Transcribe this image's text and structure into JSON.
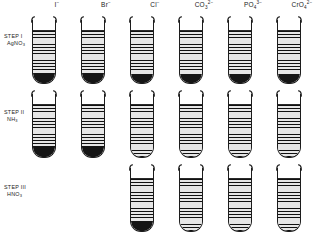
{
  "figure": {
    "tube_count_per_row": 6
  },
  "columns": [
    {
      "id": "iodide",
      "label_main": "I",
      "label_sub": "",
      "label_sup": "−",
      "x": 44
    },
    {
      "id": "bromide",
      "label_main": "Br",
      "label_sub": "",
      "label_sup": "−",
      "x": 93
    },
    {
      "id": "chloride",
      "label_main": "Cl",
      "label_sub": "",
      "label_sup": "−",
      "x": 142
    },
    {
      "id": "carbonate",
      "label_main": "CO",
      "label_sub": "3",
      "label_sup": "2−",
      "x": 191
    },
    {
      "id": "phosphate",
      "label_main": "PO",
      "label_sub": "4",
      "label_sup": "3−",
      "x": 240
    },
    {
      "id": "chromate",
      "label_main": "CrO",
      "label_sub": "4",
      "label_sup": "2−",
      "x": 289
    }
  ],
  "rows": [
    {
      "id": "step-1",
      "step_name": "STEP I",
      "reagent_main": "AgNO",
      "reagent_sub": "3",
      "label_top": 33,
      "tube_top": 16,
      "tubes": [
        {
          "column": "iodide",
          "present": true,
          "liquid_height": 52,
          "precipitate_height": 11
        },
        {
          "column": "bromide",
          "present": true,
          "liquid_height": 52,
          "precipitate_height": 11
        },
        {
          "column": "chloride",
          "present": true,
          "liquid_height": 52,
          "precipitate_height": 10
        },
        {
          "column": "carbonate",
          "present": true,
          "liquid_height": 52,
          "precipitate_height": 10
        },
        {
          "column": "phosphate",
          "present": true,
          "liquid_height": 52,
          "precipitate_height": 10
        },
        {
          "column": "chromate",
          "present": true,
          "liquid_height": 52,
          "precipitate_height": 10
        }
      ]
    },
    {
      "id": "step-2",
      "step_name": "STEP II",
      "reagent_main": "NH",
      "reagent_sub": "3",
      "label_top": 109,
      "tube_top": 90,
      "tubes": [
        {
          "column": "iodide",
          "present": true,
          "liquid_height": 52,
          "precipitate_height": 12
        },
        {
          "column": "bromide",
          "present": true,
          "liquid_height": 52,
          "precipitate_height": 12
        },
        {
          "column": "chloride",
          "present": true,
          "liquid_height": 52,
          "precipitate_height": 0
        },
        {
          "column": "carbonate",
          "present": true,
          "liquid_height": 52,
          "precipitate_height": 0
        },
        {
          "column": "phosphate",
          "present": true,
          "liquid_height": 52,
          "precipitate_height": 0
        },
        {
          "column": "chromate",
          "present": true,
          "liquid_height": 52,
          "precipitate_height": 0
        }
      ]
    },
    {
      "id": "step-3",
      "step_name": "STEP III",
      "reagent_main": "HNO",
      "reagent_sub": "3",
      "label_top": 184,
      "tube_top": 164,
      "tubes": [
        {
          "column": "iodide",
          "present": false,
          "liquid_height": 0,
          "precipitate_height": 0
        },
        {
          "column": "bromide",
          "present": false,
          "liquid_height": 0,
          "precipitate_height": 0
        },
        {
          "column": "chloride",
          "present": true,
          "liquid_height": 52,
          "precipitate_height": 11
        },
        {
          "column": "carbonate",
          "present": true,
          "liquid_height": 52,
          "precipitate_height": 0
        },
        {
          "column": "phosphate",
          "present": true,
          "liquid_height": 52,
          "precipitate_height": 0
        },
        {
          "column": "chromate",
          "present": true,
          "liquid_height": 52,
          "precipitate_height": 0
        }
      ]
    }
  ],
  "colors": {
    "glass": "#1c1c1c",
    "liquid_hatch": "#111111",
    "liquid_background": "#e6e6e6",
    "precipitate": "#151515",
    "background": "#ffffff",
    "text": "#1a1a1a"
  }
}
